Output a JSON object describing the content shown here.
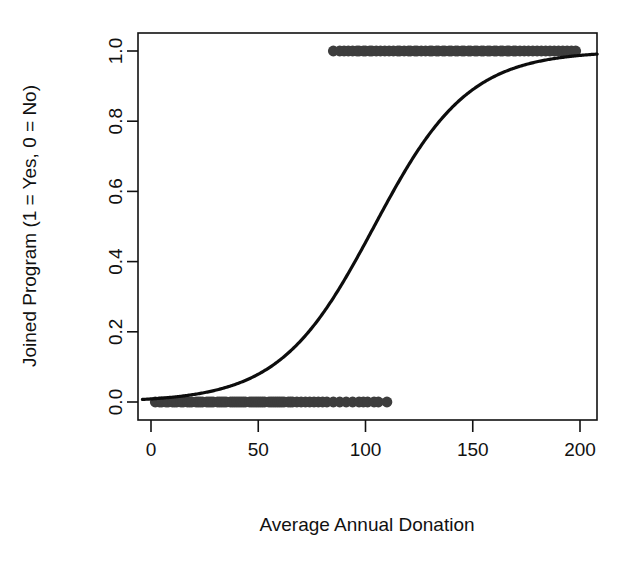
{
  "chart_data": {
    "type": "scatter",
    "title": "",
    "subtitle": "",
    "xlabel": "Average Annual Donation",
    "ylabel": "Joined Program (1 = Yes, 0 = No)",
    "xlim": [
      -4,
      208
    ],
    "ylim": [
      -0.035,
      1.035
    ],
    "xticks": [
      0,
      50,
      100,
      150,
      200
    ],
    "xtick_labels": [
      "0",
      "50",
      "100",
      "150",
      "200"
    ],
    "yticks": [
      0.0,
      0.2,
      0.4,
      0.6,
      0.8,
      1.0
    ],
    "ytick_labels": [
      "0.0",
      "0.2",
      "0.4",
      "0.6",
      "0.8",
      "1.0"
    ],
    "grid": false,
    "legend": null,
    "point_color": "#3d3d3d",
    "curve_color": "#0d0d0d",
    "frame_color": "#111111",
    "annotations": [],
    "series": [
      {
        "name": "Observed outcomes",
        "type": "scatter",
        "marker": "filled-circle",
        "x": [
          2,
          4,
          5,
          7,
          8,
          10,
          11,
          12,
          14,
          15,
          17,
          18,
          19,
          21,
          22,
          23,
          24,
          26,
          27,
          28,
          29,
          31,
          32,
          33,
          34,
          35,
          37,
          38,
          39,
          40,
          41,
          42,
          43,
          44,
          46,
          47,
          48,
          49,
          50,
          51,
          52,
          53,
          55,
          56,
          57,
          58,
          59,
          60,
          61,
          62,
          64,
          65,
          66,
          68,
          70,
          72,
          74,
          76,
          78,
          80,
          82,
          85,
          88,
          91,
          94,
          97,
          99,
          101,
          104,
          106,
          110
        ],
        "y": [
          0,
          0,
          0,
          0,
          0,
          0,
          0,
          0,
          0,
          0,
          0,
          0,
          0,
          0,
          0,
          0,
          0,
          0,
          0,
          0,
          0,
          0,
          0,
          0,
          0,
          0,
          0,
          0,
          0,
          0,
          0,
          0,
          0,
          0,
          0,
          0,
          0,
          0,
          0,
          0,
          0,
          0,
          0,
          0,
          0,
          0,
          0,
          0,
          0,
          0,
          0,
          0,
          0,
          0,
          0,
          0,
          0,
          0,
          0,
          0,
          0,
          0,
          0,
          0,
          0,
          0,
          0,
          0,
          0,
          0,
          0
        ]
      },
      {
        "name": "Observed outcomes (joined)",
        "type": "scatter",
        "marker": "filled-circle",
        "x": [
          85,
          88,
          90,
          92,
          94,
          96,
          97,
          99,
          100,
          102,
          103,
          105,
          107,
          109,
          111,
          113,
          115,
          116,
          118,
          120,
          121,
          123,
          124,
          126,
          128,
          130,
          131,
          133,
          134,
          136,
          137,
          139,
          140,
          142,
          143,
          145,
          146,
          148,
          149,
          151,
          152,
          154,
          155,
          157,
          158,
          160,
          161,
          163,
          164,
          166,
          167,
          169,
          170,
          172,
          174,
          176,
          178,
          180,
          182,
          184,
          186,
          188,
          190,
          192,
          194,
          196,
          198
        ],
        "y": [
          1,
          1,
          1,
          1,
          1,
          1,
          1,
          1,
          1,
          1,
          1,
          1,
          1,
          1,
          1,
          1,
          1,
          1,
          1,
          1,
          1,
          1,
          1,
          1,
          1,
          1,
          1,
          1,
          1,
          1,
          1,
          1,
          1,
          1,
          1,
          1,
          1,
          1,
          1,
          1,
          1,
          1,
          1,
          1,
          1,
          1,
          1,
          1,
          1,
          1,
          1,
          1,
          1,
          1,
          1,
          1,
          1,
          1,
          1,
          1,
          1,
          1,
          1,
          1,
          1,
          1,
          1
        ]
      },
      {
        "name": "Fitted logistic curve",
        "type": "line",
        "model": "logistic",
        "midpoint_x": 104,
        "slope_scale": 22,
        "asymptote_low": 0,
        "asymptote_high": 1
      }
    ]
  }
}
